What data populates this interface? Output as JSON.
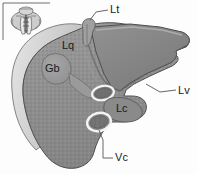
{
  "figure": {
    "kind": "anatomical-diagram",
    "background_color": "#fdfdfd",
    "organ_fill": "#8c8c8c",
    "organ_edge_fill": "#c9c9c9",
    "organ_outline": "#4a4a4a",
    "gallbladder_fill": "#9a9a9a",
    "vessel_outline": "#f2f2f2",
    "vessel_fill": "#7a7a7a",
    "label_color": "#1b1b1b",
    "leader_color": "#555555"
  },
  "inset": {
    "name": "orientation-thumbnail",
    "border_color": "#6f6f6f",
    "fill": "#cfcfcf",
    "detail": "#5a5a5a"
  },
  "labels": {
    "lt": "Lt",
    "lq": "Lq",
    "gb": "Gb",
    "lc": "Lc",
    "lv": "Lv",
    "vc": "Vc"
  }
}
